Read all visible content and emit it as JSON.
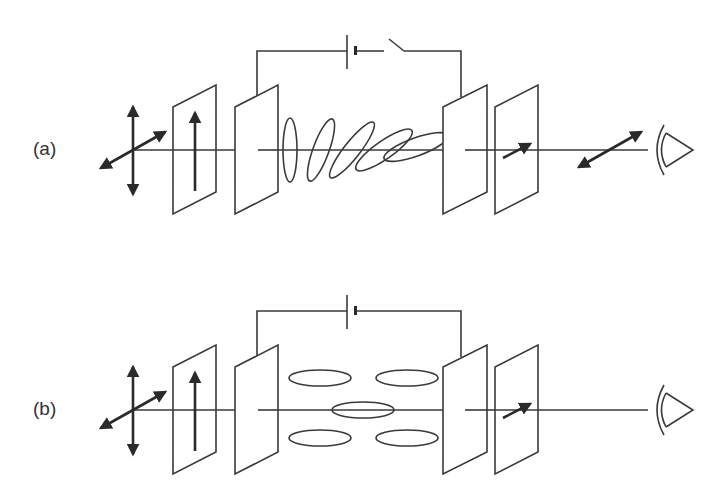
{
  "figure": {
    "type": "twisted-nematic liquid crystal cell schematic",
    "colors": {
      "line": "#3a3a3a",
      "arrow": "#2a2a2a",
      "background": "#ffffff"
    },
    "panels": [
      {
        "id": "a",
        "label": "(a)",
        "switch_state": "open",
        "input_light": "unpolarized",
        "input_polarizer_axis": "vertical",
        "molecule_alignment": "twisted",
        "molecule_count": 5,
        "output_polarizer_axis": "diagonal",
        "output_light": "transmitted",
        "components": [
          "light-source",
          "polarizer",
          "glass-plate",
          "liquid-crystal",
          "glass-plate",
          "analyzer",
          "eye"
        ],
        "circuit": [
          "battery",
          "switch"
        ]
      },
      {
        "id": "b",
        "label": "(b)",
        "switch_state": "closed",
        "input_light": "unpolarized",
        "input_polarizer_axis": "vertical",
        "molecule_alignment": "aligned-with-field",
        "molecule_count": 5,
        "output_polarizer_axis": "diagonal",
        "output_light": "blocked",
        "components": [
          "light-source",
          "polarizer",
          "glass-plate",
          "liquid-crystal",
          "glass-plate",
          "analyzer",
          "eye"
        ],
        "circuit": [
          "battery"
        ]
      }
    ]
  }
}
